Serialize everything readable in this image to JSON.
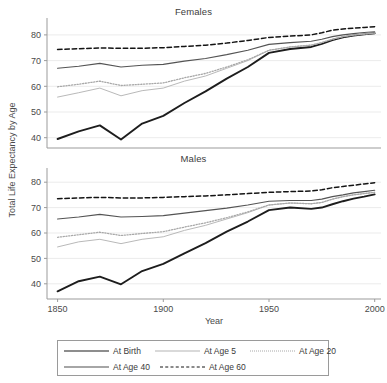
{
  "figure": {
    "ylabel": "Total Life Expectancy by Age",
    "xlabel": "Year"
  },
  "panels": {
    "females": {
      "title": "Females"
    },
    "males": {
      "title": "Males"
    }
  },
  "legend": {
    "items": [
      {
        "label": "At Birth",
        "key": "at-birth",
        "style": "solid-thick-dark",
        "color": "#1d1d1d"
      },
      {
        "label": "At Age 5",
        "key": "at-age-5",
        "style": "solid-light",
        "color": "#b4b4b4"
      },
      {
        "label": "At Age 20",
        "key": "at-age-20",
        "style": "dotted",
        "color": "#a8a8a8"
      },
      {
        "label": "At Age 40",
        "key": "at-age-40",
        "style": "solid-medium",
        "color": "#4f4f4f"
      },
      {
        "label": "At Age 60",
        "key": "at-age-60",
        "style": "dashed",
        "color": "#141414"
      }
    ]
  },
  "chart_data": [
    {
      "type": "line",
      "title": "Females",
      "xlabel": "Year",
      "ylabel": "Total Life Expectancy by Age",
      "xlim": [
        1845,
        2003
      ],
      "ylim": [
        36,
        85
      ],
      "xticks": [
        1850,
        1900,
        1950,
        2000
      ],
      "yticks": [
        40,
        50,
        60,
        70,
        80
      ],
      "grid": "horizontal",
      "legend_position": "below-figure",
      "x": [
        1850,
        1860,
        1870,
        1880,
        1890,
        1900,
        1910,
        1920,
        1930,
        1940,
        1950,
        1960,
        1970,
        1975,
        1980,
        1985,
        1990,
        1995,
        2000
      ],
      "series": [
        {
          "name": "At Birth",
          "values": [
            39.5,
            42.5,
            44.8,
            39.3,
            45.5,
            48.5,
            53.5,
            58.0,
            63.0,
            67.5,
            73.0,
            74.5,
            75.3,
            76.5,
            78.0,
            79.0,
            79.7,
            80.2,
            80.6
          ]
        },
        {
          "name": "At Age 5",
          "values": [
            55.8,
            57.5,
            59.3,
            56.3,
            58.3,
            59.3,
            62.0,
            64.0,
            67.0,
            70.0,
            74.0,
            75.3,
            76.0,
            77.0,
            78.3,
            79.3,
            79.9,
            80.3,
            80.7
          ]
        },
        {
          "name": "At Age 20",
          "values": [
            59.8,
            60.8,
            62.0,
            60.3,
            60.8,
            61.3,
            63.3,
            65.0,
            67.5,
            70.3,
            74.0,
            75.3,
            76.0,
            77.0,
            78.3,
            79.3,
            79.9,
            80.3,
            80.7
          ]
        },
        {
          "name": "At Age 40",
          "values": [
            67.0,
            67.8,
            68.9,
            67.5,
            68.2,
            68.5,
            69.8,
            70.8,
            72.3,
            74.0,
            76.3,
            77.0,
            77.5,
            78.3,
            79.3,
            80.0,
            80.5,
            80.9,
            81.2
          ]
        },
        {
          "name": "At Age 60",
          "values": [
            74.3,
            74.6,
            74.9,
            74.8,
            74.8,
            75.0,
            75.5,
            76.0,
            76.8,
            77.8,
            79.0,
            79.5,
            80.0,
            80.8,
            81.8,
            82.3,
            82.6,
            82.9,
            83.2
          ]
        }
      ]
    },
    {
      "type": "line",
      "title": "Males",
      "xlabel": "Year",
      "ylabel": "Total Life Expectancy by Age",
      "xlim": [
        1845,
        2003
      ],
      "ylim": [
        34,
        84
      ],
      "xticks": [
        1850,
        1900,
        1950,
        2000
      ],
      "yticks": [
        40,
        50,
        60,
        70,
        80
      ],
      "grid": "horizontal",
      "legend_position": "below-figure",
      "x": [
        1850,
        1860,
        1870,
        1880,
        1890,
        1900,
        1910,
        1920,
        1930,
        1940,
        1950,
        1960,
        1970,
        1975,
        1980,
        1985,
        1990,
        1995,
        2000
      ],
      "series": [
        {
          "name": "At Birth",
          "values": [
            37.0,
            41.0,
            42.8,
            39.8,
            45.0,
            47.8,
            52.0,
            56.0,
            60.5,
            64.5,
            69.0,
            70.0,
            69.5,
            70.0,
            71.3,
            72.5,
            73.5,
            74.3,
            75.2
          ]
        },
        {
          "name": "At Age 5",
          "values": [
            54.5,
            56.5,
            57.5,
            55.8,
            57.5,
            58.5,
            61.0,
            63.0,
            65.5,
            68.0,
            71.0,
            71.8,
            71.5,
            72.0,
            73.3,
            74.3,
            75.0,
            75.5,
            76.0
          ]
        },
        {
          "name": "At Age 20",
          "values": [
            58.3,
            59.3,
            60.3,
            59.0,
            59.8,
            60.5,
            62.3,
            64.0,
            66.0,
            68.3,
            71.0,
            71.8,
            71.5,
            72.0,
            73.3,
            74.3,
            75.0,
            75.5,
            76.0
          ]
        },
        {
          "name": "At Age 40",
          "values": [
            65.5,
            66.3,
            67.3,
            66.3,
            66.5,
            66.8,
            67.8,
            68.8,
            69.8,
            71.0,
            72.5,
            72.8,
            72.8,
            73.3,
            74.3,
            75.0,
            75.8,
            76.3,
            76.8
          ]
        },
        {
          "name": "At Age 60",
          "values": [
            73.5,
            73.8,
            74.0,
            73.8,
            73.8,
            74.0,
            74.3,
            74.6,
            75.0,
            75.5,
            76.0,
            76.3,
            76.5,
            77.0,
            77.8,
            78.3,
            78.8,
            79.3,
            79.8
          ]
        }
      ]
    }
  ]
}
